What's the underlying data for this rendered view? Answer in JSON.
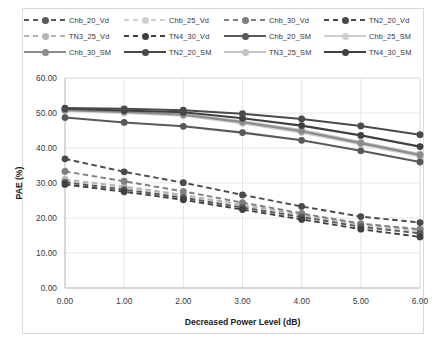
{
  "chart_data": {
    "type": "line",
    "title": "",
    "xlabel": "Decreased Power  Level (dB)",
    "ylabel": "PAE (%)",
    "x": [
      0.0,
      1.0,
      2.0,
      3.0,
      4.0,
      5.0,
      6.0
    ],
    "xtick_labels": [
      "0.00",
      "1.00",
      "2.00",
      "3.00",
      "4.00",
      "5.00",
      "6.00"
    ],
    "ytick_labels": [
      "0.00",
      "10.00",
      "20.00",
      "30.00",
      "40.00",
      "50.00",
      "60.00"
    ],
    "xlim": [
      0,
      6
    ],
    "ylim": [
      0,
      60
    ],
    "grid": true,
    "legend_position": "top",
    "series": [
      {
        "name": "Chb_20_Vd",
        "style": "dashed",
        "color": "#595959",
        "values": [
          30.2,
          28.1,
          25.8,
          23.0,
          20.3,
          17.5,
          15.6
        ]
      },
      {
        "name": "Chb_25_Vd",
        "style": "dashed",
        "color": "#cfcfcf",
        "values": [
          30.6,
          28.6,
          26.3,
          23.5,
          20.8,
          18.0,
          16.2
        ]
      },
      {
        "name": "Chb_30_Vd",
        "style": "dashed",
        "color": "#7f7f7f",
        "values": [
          33.3,
          30.5,
          27.6,
          24.4,
          21.3,
          18.4,
          16.8
        ]
      },
      {
        "name": "TN2_20_Vd",
        "style": "dashed",
        "color": "#4a4a4a",
        "values": [
          36.9,
          33.2,
          30.1,
          26.6,
          23.3,
          20.4,
          18.7
        ]
      },
      {
        "name": "TN3_25_Vd",
        "style": "dashed",
        "color": "#b5b5b5",
        "values": [
          31.0,
          29.0,
          26.6,
          23.8,
          21.0,
          18.2,
          16.5
        ]
      },
      {
        "name": "TN4_30_Vd",
        "style": "dashed",
        "color": "#404040",
        "values": [
          29.6,
          27.5,
          25.2,
          22.4,
          19.6,
          16.8,
          14.6
        ]
      },
      {
        "name": "Chb_20_SM",
        "style": "solid",
        "color": "#595959",
        "values": [
          48.7,
          47.3,
          46.2,
          44.4,
          42.2,
          39.2,
          36.0
        ]
      },
      {
        "name": "Chb_25_SM",
        "style": "solid",
        "color": "#cfcfcf",
        "values": [
          50.6,
          50.0,
          49.2,
          47.0,
          44.4,
          41.0,
          37.6
        ]
      },
      {
        "name": "Chb_30_SM",
        "style": "solid",
        "color": "#8c8c8c",
        "values": [
          50.8,
          50.3,
          49.5,
          47.4,
          44.8,
          41.4,
          38.0
        ]
      },
      {
        "name": "TN2_20_SM",
        "style": "solid",
        "color": "#4a4a4a",
        "values": [
          51.4,
          51.2,
          50.8,
          49.8,
          48.3,
          46.3,
          43.8
        ]
      },
      {
        "name": "TN3_25_SM",
        "style": "solid",
        "color": "#c2c2c2",
        "values": [
          50.9,
          50.4,
          49.7,
          47.6,
          45.1,
          41.7,
          38.3
        ]
      },
      {
        "name": "TN4_30_SM",
        "style": "solid",
        "color": "#404040",
        "values": [
          51.2,
          50.7,
          50.2,
          48.5,
          46.4,
          43.6,
          40.4
        ]
      }
    ]
  },
  "legend": {
    "items": [
      {
        "label": "Chb_20_Vd"
      },
      {
        "label": "Chb_25_Vd"
      },
      {
        "label": "Chb_30_Vd"
      },
      {
        "label": "TN2_20_Vd"
      },
      {
        "label": "TN3_25_Vd"
      },
      {
        "label": "TN4_30_Vd"
      },
      {
        "label": "Chb_20_SM"
      },
      {
        "label": "Chb_25_SM"
      },
      {
        "label": "Chb_30_SM"
      },
      {
        "label": "TN2_20_SM"
      },
      {
        "label": "TN3_25_SM"
      },
      {
        "label": "TN4_30_SM"
      }
    ]
  },
  "colors": {
    "grid": "#e3e3e3",
    "axis": "#bfbfbf",
    "text": "#333333",
    "border": "#d9d9d9"
  }
}
